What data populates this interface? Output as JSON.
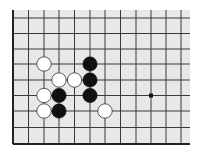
{
  "board": {
    "background": "#e8e8e8",
    "line_color": "#3a3a3a",
    "edge_color": "#222222",
    "area": {
      "x1": 12,
      "y1": 10,
      "x2": 190,
      "y2": 145
    },
    "vlines": [
      13,
      28.5,
      44,
      59,
      74.5,
      90,
      105,
      120.5,
      136,
      151,
      166,
      181
    ],
    "hlines": [
      18,
      33.5,
      49,
      64,
      80,
      95.5,
      111,
      127.5,
      144
    ],
    "edges": {
      "left": true,
      "bottom": true,
      "top": false,
      "right": false
    },
    "star_points": [
      {
        "col": 9,
        "row": 5
      }
    ],
    "stones": [
      {
        "color": "white",
        "col": 2,
        "row": 3
      },
      {
        "color": "black",
        "col": 5,
        "row": 3
      },
      {
        "color": "white",
        "col": 3,
        "row": 4
      },
      {
        "color": "white",
        "col": 4,
        "row": 4
      },
      {
        "color": "black",
        "col": 5,
        "row": 4
      },
      {
        "color": "white",
        "col": 2,
        "row": 5
      },
      {
        "color": "black",
        "col": 3,
        "row": 5
      },
      {
        "color": "black",
        "col": 5,
        "row": 5
      },
      {
        "color": "white",
        "col": 2,
        "row": 6
      },
      {
        "color": "black",
        "col": 3,
        "row": 6
      },
      {
        "color": "white",
        "col": 6,
        "row": 6
      }
    ],
    "stone_radius": 7.2,
    "colors": {
      "black": "#111111",
      "white": "#ffffff",
      "white_stroke": "#333333"
    }
  }
}
